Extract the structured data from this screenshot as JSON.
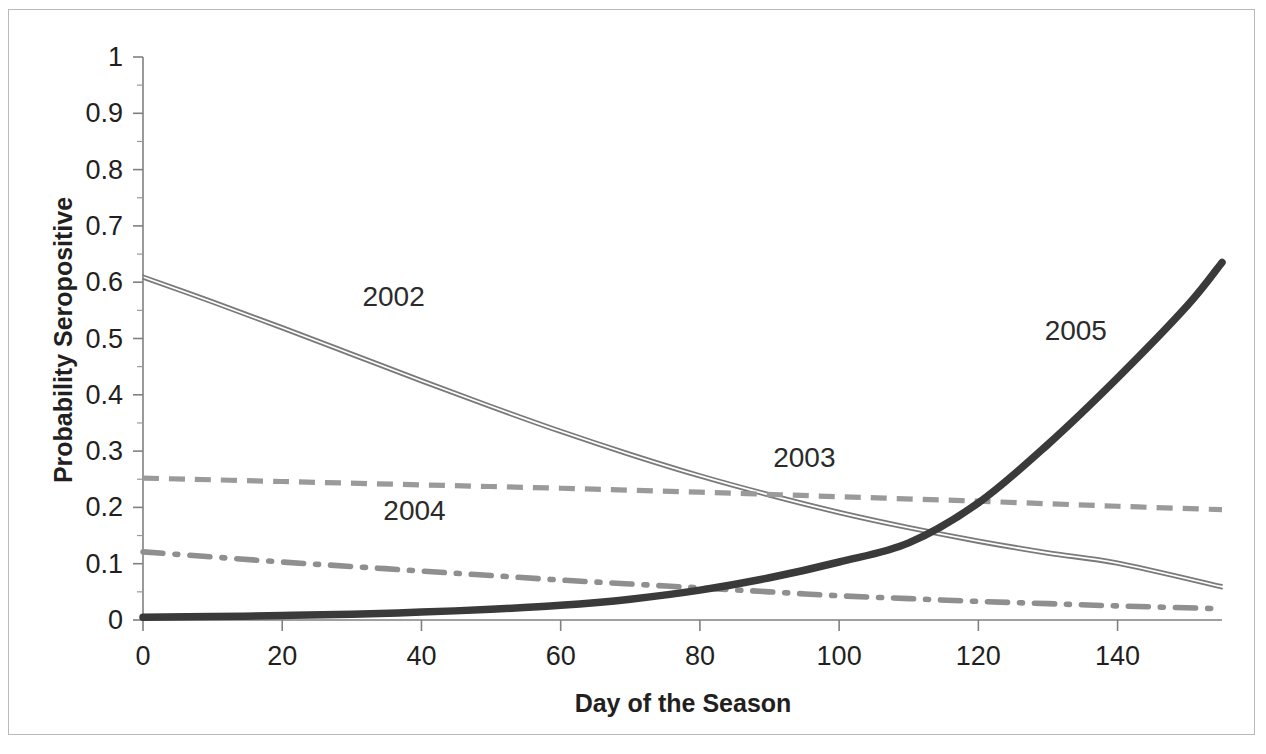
{
  "chart_data": {
    "type": "line",
    "title": "",
    "xlabel": "Day of the Season",
    "ylabel": "Probability Seropositive",
    "xlim": [
      0,
      155
    ],
    "ylim": [
      0,
      1
    ],
    "xticks": [
      "0",
      "20",
      "40",
      "60",
      "80",
      "100",
      "120",
      "140"
    ],
    "xtick_values": [
      0,
      20,
      40,
      60,
      80,
      100,
      120,
      140
    ],
    "yticks": [
      "0",
      "0.1",
      "0.2",
      "0.3",
      "0.4",
      "0.5",
      "0.6",
      "0.7",
      "0.8",
      "0.9",
      "1"
    ],
    "ytick_values": [
      0,
      0.1,
      0.2,
      0.3,
      0.4,
      0.5,
      0.6,
      0.7,
      0.8,
      0.9,
      1
    ],
    "y_minor_step": 0.05,
    "grid": false,
    "legend": "inline-labels",
    "series": [
      {
        "name": "2002",
        "label": "2002",
        "style": "double-thin-line",
        "color": "#7a7a7a",
        "label_x": 36,
        "label_y": 0.558,
        "x": [
          0,
          10,
          20,
          30,
          40,
          50,
          60,
          70,
          80,
          90,
          100,
          110,
          120,
          130,
          140,
          155
        ],
        "y": [
          0.607,
          0.563,
          0.517,
          0.47,
          0.423,
          0.377,
          0.333,
          0.292,
          0.254,
          0.22,
          0.189,
          0.162,
          0.138,
          0.117,
          0.099,
          0.057
        ]
      },
      {
        "name": "2003",
        "label": "2003",
        "style": "dashed-line",
        "color": "#9a9a9a",
        "label_x": 95,
        "label_y": 0.272,
        "x": [
          0,
          20,
          40,
          60,
          80,
          100,
          120,
          140,
          155
        ],
        "y": [
          0.252,
          0.246,
          0.24,
          0.234,
          0.227,
          0.219,
          0.211,
          0.202,
          0.196
        ]
      },
      {
        "name": "2004",
        "label": "2004",
        "style": "dash-dot-line",
        "color": "#8f8f8f",
        "label_x": 39,
        "label_y": 0.177,
        "x": [
          0,
          10,
          20,
          30,
          40,
          50,
          60,
          70,
          80,
          90,
          100,
          110,
          120,
          130,
          140,
          155
        ],
        "y": [
          0.121,
          0.112,
          0.103,
          0.095,
          0.087,
          0.079,
          0.071,
          0.064,
          0.057,
          0.05,
          0.043,
          0.038,
          0.033,
          0.029,
          0.025,
          0.02
        ]
      },
      {
        "name": "2005",
        "label": "2005",
        "style": "thick-solid-line",
        "color": "#3a3a3a",
        "label_x": 134,
        "label_y": 0.497,
        "x": [
          0,
          10,
          20,
          30,
          40,
          50,
          60,
          70,
          80,
          90,
          100,
          110,
          120,
          130,
          140,
          150,
          155
        ],
        "y": [
          0.005,
          0.006,
          0.008,
          0.01,
          0.014,
          0.019,
          0.026,
          0.037,
          0.053,
          0.075,
          0.103,
          0.137,
          0.208,
          0.312,
          0.43,
          0.558,
          0.635
        ]
      }
    ],
    "annotations": [
      {
        "text": "2002",
        "x": 36,
        "y": 0.558
      },
      {
        "text": "2003",
        "x": 95,
        "y": 0.272
      },
      {
        "text": "2004",
        "x": 39,
        "y": 0.177
      },
      {
        "text": "2005",
        "x": 134,
        "y": 0.497
      }
    ]
  },
  "axes": {
    "x_title": "Day of the Season",
    "y_title": "Probability Seropositive"
  },
  "colors": {
    "axis": "#808080",
    "text": "#231f20",
    "border": "#b9b9b9",
    "background": "#ffffff"
  }
}
